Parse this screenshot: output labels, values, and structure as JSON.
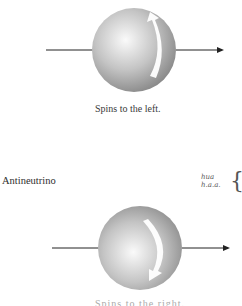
{
  "diagrams": [
    {
      "name": "top-particle",
      "spin_arrow_direction": "up",
      "caption": "Spins to the left."
    },
    {
      "name": "antineutrino",
      "label": "Antineutrino",
      "spin_arrow_direction": "down",
      "caption": "Spins to the right."
    }
  ],
  "handwritten_note": {
    "line1": "hua",
    "line2": "h.a.a.",
    "bracket": "{"
  },
  "colors": {
    "sphere_light": "#f4f4f4",
    "sphere_dark": "#8c8c8c",
    "axis_line": "#222222",
    "spin_arrow": "#ffffff"
  }
}
